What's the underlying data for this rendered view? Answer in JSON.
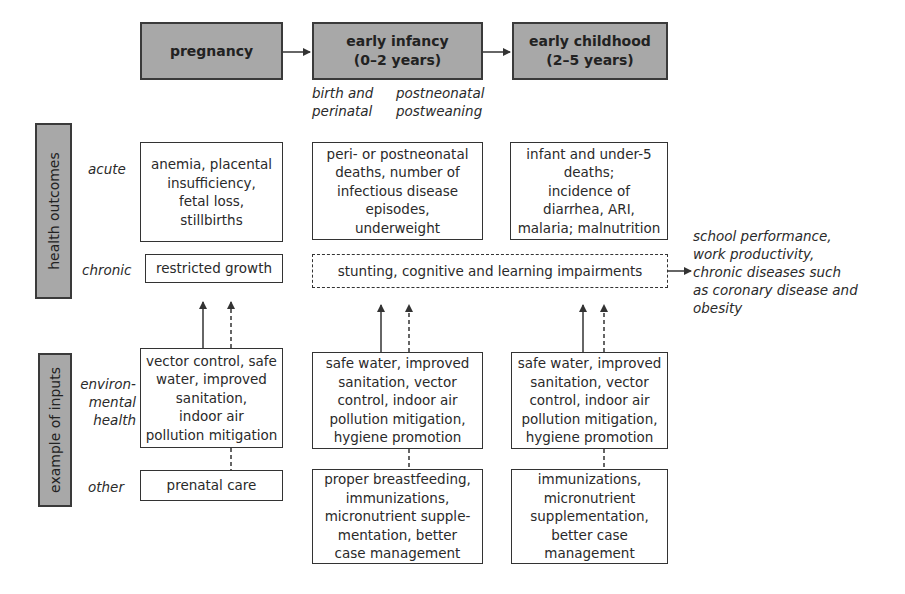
{
  "stages": [
    {
      "label": "pregnancy"
    },
    {
      "label": "early infancy\n(0–2 years)"
    },
    {
      "label": "early childhood\n(2–5 years)"
    }
  ],
  "sub_stages": {
    "birth": "birth and\nperinatal",
    "postneonatal": "postneonatal\npostweaning"
  },
  "row_groups": {
    "health_outcomes": "health outcomes",
    "inputs": "example of inputs"
  },
  "row_labels": {
    "acute": "acute",
    "chronic": "chronic",
    "environmental": "environ-\nmental\nhealth",
    "other": "other"
  },
  "acute": [
    "anemia, placental\ninsufficiency,\nfetal loss,\nstillbirths",
    "peri- or postneonatal\ndeaths, number of\ninfectious disease\nepisodes,\nunderweight",
    "infant and under-5\ndeaths;\nincidence of\ndiarrhea, ARI,\nmalaria; malnutrition"
  ],
  "chronic": {
    "pregnancy": "restricted growth",
    "childhood": "stunting, cognitive and learning impairments"
  },
  "long_term_outcomes": "school performance,\nwork productivity,\nchronic diseases such\nas coronary disease and\nobesity",
  "environmental": [
    "vector control, safe\nwater, improved\nsanitation,\nindoor air\npollution mitigation",
    "safe water, improved\nsanitation, vector\ncontrol, indoor air\npollution mitigation,\nhygiene promotion",
    "safe water, improved\nsanitation, vector\ncontrol, indoor air\npollution mitigation,\nhygiene promotion"
  ],
  "other": [
    "prenatal care",
    "proper breastfeeding,\nimmunizations,\nmicronutrient supple-\nmentation, better\ncase management",
    "immunizations,\nmicronutrient\nsupplementation,\nbetter case\nmanagement"
  ],
  "colors": {
    "stage_fill": "#a8a8a8",
    "border": "#333333",
    "text": "#2a2a2a"
  }
}
